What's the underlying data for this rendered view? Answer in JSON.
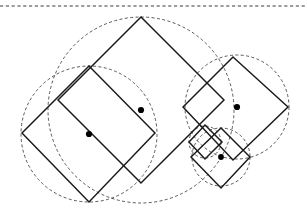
{
  "figure": {
    "background_color": "#ffffff",
    "solid_stroke_color": "#1a1a1a",
    "dashed_stroke_color": "#3a3a3a",
    "dot_color": "#000000",
    "width": 307,
    "height": 217
  },
  "top_rule": {
    "name": "dashed horizontal rule",
    "y": 6,
    "x1": 0,
    "x2": 307,
    "style": "dashed"
  },
  "circles": [
    {
      "id": "circle-large-outer",
      "label": "large circumscribed circle",
      "cx": 141,
      "cy": 110,
      "r": 93,
      "style": "dashed"
    },
    {
      "id": "circle-left-medium",
      "label": "left medium circumscribed circle",
      "cx": 89,
      "cy": 134,
      "r": 68,
      "style": "dashed"
    },
    {
      "id": "circle-right-medium",
      "label": "right medium circumscribed circle",
      "cx": 237,
      "cy": 107,
      "r": 52,
      "style": "dashed"
    },
    {
      "id": "circle-right-small",
      "label": "right small circumscribed circle",
      "cx": 221,
      "cy": 157,
      "r": 29,
      "style": "dashed"
    },
    {
      "id": "circle-right-tiny",
      "label": "right tiny circumscribed circle",
      "cx": 205,
      "cy": 142,
      "r": 16,
      "style": "dashed"
    }
  ],
  "squares": [
    {
      "id": "square-large",
      "label": "large rotated square",
      "points": "141,17 224,100 141,183 58,100",
      "style": "solid"
    },
    {
      "id": "square-left",
      "label": "left rotated square",
      "points": "89,66 155,133 89,202 22,133",
      "style": "solid"
    },
    {
      "id": "square-right-medium",
      "label": "right medium rotated square",
      "points": "233,57 288,107 233,160 183,107",
      "style": "solid"
    },
    {
      "id": "square-right-small",
      "label": "right small rotated square",
      "points": "221,128 250,157 221,188 191,157",
      "style": "solid"
    },
    {
      "id": "square-right-tiny",
      "label": "right tiny rotated square",
      "points": "205,125 222,142 205,159 189,142",
      "style": "solid"
    }
  ],
  "center_dots": [
    {
      "id": "dot-left-square-center",
      "label": "center of left square",
      "cx": 89,
      "cy": 134,
      "r": 3.1
    },
    {
      "id": "dot-large-square-center",
      "label": "center of large square",
      "cx": 141,
      "cy": 110,
      "r": 3.1
    },
    {
      "id": "dot-right-medium-center",
      "label": "center of right medium square",
      "cx": 237,
      "cy": 107,
      "r": 3.1
    },
    {
      "id": "dot-right-small-center",
      "label": "center of right small square",
      "cx": 221,
      "cy": 157,
      "r": 2.9
    }
  ],
  "chart_data": {
    "type": "diagram",
    "grid": false,
    "legend": false,
    "elements": {
      "dashed_circles": 5,
      "solid_squares": 5,
      "center_dots": 4,
      "dashed_rules": 1
    }
  }
}
